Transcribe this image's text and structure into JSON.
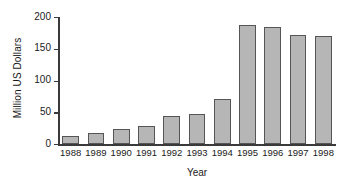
{
  "chart_data": {
    "type": "bar",
    "title": "",
    "xlabel": "Year",
    "ylabel": "Million US Dollars",
    "categories": [
      "1988",
      "1989",
      "1990",
      "1991",
      "1992",
      "1993",
      "1994",
      "1995",
      "1996",
      "1997",
      "1998"
    ],
    "values": [
      13,
      17,
      24,
      29,
      44,
      48,
      71,
      187,
      185,
      172,
      170
    ],
    "ylim": [
      0,
      200
    ],
    "yticks": [
      0,
      50,
      100,
      150,
      200
    ],
    "ytick_labels": [
      "0",
      "50",
      "100",
      "150",
      "200"
    ],
    "grid": false,
    "legend": null,
    "bar_color": "#b6b6b6",
    "bar_edge_color": "#555555",
    "axis_color": "#3a3a3a",
    "background": "#ffffff"
  }
}
